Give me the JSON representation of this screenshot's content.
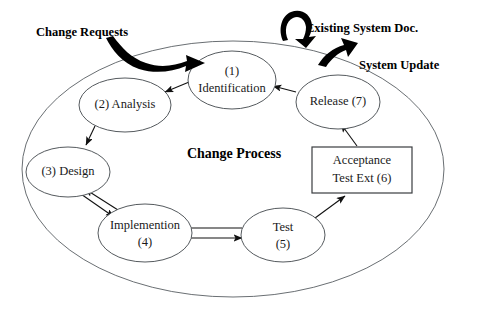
{
  "diagram": {
    "title": "Change Process",
    "center_label": "Change Process",
    "nodes": {
      "identification": {
        "line1": "(1)",
        "line2": "Identification"
      },
      "analysis": {
        "line1": "(2) Analysis"
      },
      "design": {
        "line1": "(3) Design"
      },
      "implementation": {
        "line1": "Implemention",
        "line2": "(4)"
      },
      "test": {
        "line1": "Test",
        "line2": "(5)"
      },
      "acceptance": {
        "line1": "Acceptance",
        "line2": "Test Ext (6)"
      },
      "release": {
        "line1": "Release (7)"
      }
    },
    "annotations": {
      "change_requests": "Change Requests",
      "existing_system_doc": "Existing System Doc.",
      "system_update": "System Update"
    },
    "colors": {
      "background": "#ffffff",
      "node_stroke": "#555a5e",
      "outer_stroke": "#6a6f73",
      "box_stroke": "#3a3d40",
      "arrow": "#111111",
      "text": "#1a1a1a",
      "bold_text": "#000000"
    }
  }
}
